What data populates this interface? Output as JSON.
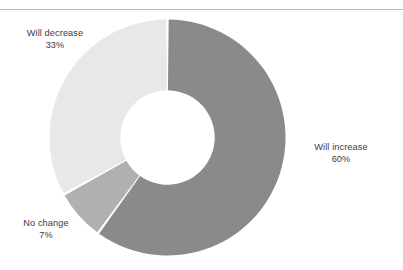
{
  "figure": {
    "background_color": "#ffffff",
    "rule_color": "#b9b9bd",
    "label_color": "#3c3c3c"
  },
  "chart_data": {
    "type": "pie",
    "variant": "donut",
    "title": "",
    "subtitle": "",
    "xlabel": "",
    "ylabel": "",
    "legend_position": "none",
    "grid": false,
    "units": "percent",
    "total": 100,
    "start_angle_deg": 0,
    "direction": "clockwise",
    "inner_radius_ratio": 0.4,
    "slice_gap": true,
    "slice_gap_color": "#ffffff",
    "categories": [
      "Will increase",
      "No change",
      "Will decrease"
    ],
    "values": [
      60,
      7,
      33
    ],
    "colors": [
      "#8a8a8a",
      "#b0b0b0",
      "#e8e8e8"
    ],
    "slices": [
      {
        "label": "Will increase",
        "value": 60,
        "value_text": "60%",
        "color": "#8a8a8a",
        "start_deg": 0,
        "end_deg": 216
      },
      {
        "label": "No change",
        "value": 7,
        "value_text": "7%",
        "color": "#b0b0b0",
        "start_deg": 216,
        "end_deg": 241.2
      },
      {
        "label": "Will decrease",
        "value": 33,
        "value_text": "33%",
        "color": "#e8e8e8",
        "start_deg": 241.2,
        "end_deg": 360
      }
    ]
  },
  "labels": {
    "increase": {
      "name": "Will increase",
      "percent": "60%"
    },
    "nochange": {
      "name": "No change",
      "percent": "7%"
    },
    "decrease": {
      "name": "Will decrease",
      "percent": "33%"
    }
  }
}
